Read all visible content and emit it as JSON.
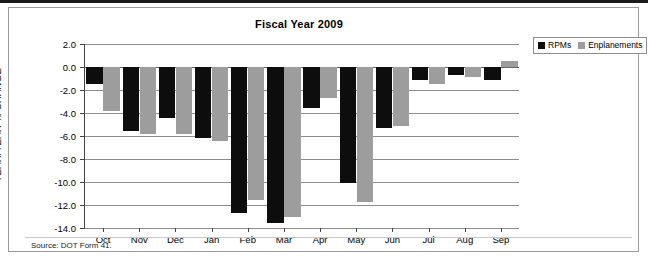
{
  "figure": {
    "source_note": "Source: DOT Form 41."
  },
  "legend": {
    "position": "top-right",
    "items": [
      {
        "label": "RPMs",
        "color": "#0d0d0d"
      },
      {
        "label": "Enplanements",
        "color": "#9d9d9d"
      }
    ]
  },
  "chart_data": {
    "type": "bar",
    "title": "Fiscal Year 2009",
    "xlabel": "",
    "ylabel": "YEAR/YEAR % CHANGE",
    "ylim": [
      -14.0,
      2.0
    ],
    "yticks": [
      "2.0",
      "0.0",
      "-2.0",
      "-4.0",
      "-6.0",
      "-8.0",
      "-10.0",
      "-12.0",
      "-14.0"
    ],
    "ytick_values": [
      2.0,
      0.0,
      -2.0,
      -4.0,
      -6.0,
      -8.0,
      -10.0,
      -12.0,
      -14.0
    ],
    "grid": true,
    "legend_position": "top-right",
    "categories": [
      "Oct",
      "Nov",
      "Dec",
      "Jan",
      "Feb",
      "Mar",
      "Apr",
      "May",
      "Jun",
      "Jul",
      "Aug",
      "Sep"
    ],
    "series": [
      {
        "name": "RPMs",
        "color": "#0d0d0d",
        "values": [
          -1.5,
          -5.6,
          -4.4,
          -6.2,
          -12.7,
          -13.6,
          -3.6,
          -10.1,
          -5.3,
          -1.1,
          -0.7,
          -1.1
        ]
      },
      {
        "name": "Enplanements",
        "color": "#9d9d9d",
        "values": [
          -3.8,
          -5.8,
          -5.8,
          -6.4,
          -11.6,
          -13.0,
          -2.7,
          -11.7,
          -5.1,
          -1.5,
          -0.9,
          0.5
        ]
      }
    ]
  }
}
